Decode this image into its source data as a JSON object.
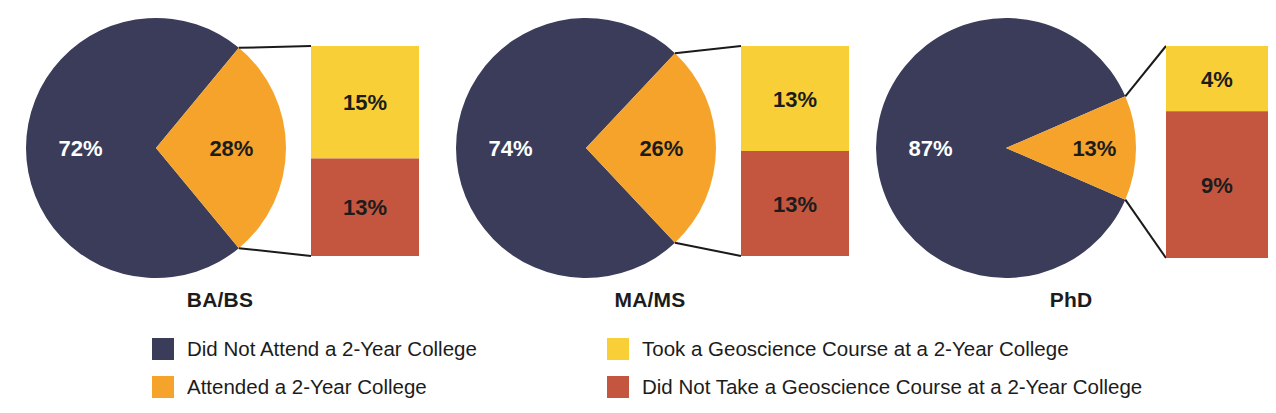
{
  "figure": {
    "background_color": "#ffffff",
    "width": 1276,
    "height": 413
  },
  "colors": {
    "navy": "#3a3c5a",
    "orange": "#f5a32a",
    "yellow": "#f8cf36",
    "red": "#c4563f",
    "leader_line": "#1a1a1a",
    "label_dark": "#1c1c1c",
    "label_light": "#ffffff"
  },
  "legend": {
    "columns": [
      {
        "items": [
          {
            "swatch_color": "#3a3c5a",
            "label": "Did Not Attend a 2-Year College"
          },
          {
            "swatch_color": "#f5a32a",
            "label": "Attended a 2-Year College"
          }
        ]
      },
      {
        "items": [
          {
            "swatch_color": "#f8cf36",
            "label": "Took a Geoscience Course at a 2-Year College"
          },
          {
            "swatch_color": "#c4563f",
            "label": "Did Not Take a Geoscience Course at a 2-Year College"
          }
        ]
      }
    ]
  },
  "chart_data": {
    "type": "pie",
    "title": "",
    "subtitle": "",
    "xlabel": "",
    "ylabel": "",
    "legend_position": "bottom",
    "grid": false,
    "note": "Three pie charts, one per degree level, each with an exploded bar-of-pie breakdown of the 'Attended a 2-Year College' slice.",
    "series_names": [
      "Did Not Attend a 2-Year College",
      "Attended a 2-Year College",
      "Took a Geoscience Course at a 2-Year College",
      "Did Not Take a Geoscience Course at a 2-Year College"
    ],
    "categories": [
      "BA/BS",
      "MA/MS",
      "PhD"
    ],
    "charts": [
      {
        "label": "BA/BS",
        "pie": {
          "slices": [
            {
              "name": "Did Not Attend a 2-Year College",
              "value": 72,
              "display": "72%",
              "color": "#3a3c5a",
              "label_color": "#ffffff"
            },
            {
              "name": "Attended a 2-Year College",
              "value": 28,
              "display": "28%",
              "color": "#f5a32a",
              "label_color": "#1c1c1c"
            }
          ]
        },
        "bar": {
          "segments": [
            {
              "name": "Took a Geoscience Course at a 2-Year College",
              "value": 15,
              "display": "15%",
              "color": "#f8cf36",
              "label_color": "#1c1c1c"
            },
            {
              "name": "Did Not Take a Geoscience Course at a 2-Year College",
              "value": 13,
              "display": "13%",
              "color": "#c4563f",
              "label_color": "#1c1c1c"
            }
          ],
          "total": 28
        }
      },
      {
        "label": "MA/MS",
        "pie": {
          "slices": [
            {
              "name": "Did Not Attend a 2-Year College",
              "value": 74,
              "display": "74%",
              "color": "#3a3c5a",
              "label_color": "#ffffff"
            },
            {
              "name": "Attended a 2-Year College",
              "value": 26,
              "display": "26%",
              "color": "#f5a32a",
              "label_color": "#1c1c1c"
            }
          ]
        },
        "bar": {
          "segments": [
            {
              "name": "Took a Geoscience Course at a 2-Year College",
              "value": 13,
              "display": "13%",
              "color": "#f8cf36",
              "label_color": "#1c1c1c"
            },
            {
              "name": "Did Not Take a Geoscience Course at a 2-Year College",
              "value": 13,
              "display": "13%",
              "color": "#c4563f",
              "label_color": "#1c1c1c"
            }
          ],
          "total": 26
        }
      },
      {
        "label": "PhD",
        "pie": {
          "slices": [
            {
              "name": "Did Not Attend a 2-Year College",
              "value": 87,
              "display": "87%",
              "color": "#3a3c5a",
              "label_color": "#ffffff"
            },
            {
              "name": "Attended a 2-Year College",
              "value": 13,
              "display": "13%",
              "color": "#f5a32a",
              "label_color": "#1c1c1c"
            }
          ]
        },
        "bar": {
          "segments": [
            {
              "name": "Took a Geoscience Course at a 2-Year College",
              "value": 4,
              "display": "4%",
              "color": "#f8cf36",
              "label_color": "#1c1c1c"
            },
            {
              "name": "Did Not Take a Geoscience Course at a 2-Year College",
              "value": 9,
              "display": "9%",
              "color": "#c4563f",
              "label_color": "#1c1c1c"
            }
          ],
          "total": 13
        }
      }
    ]
  },
  "layout": {
    "groups": [
      {
        "left": 8,
        "width": 424,
        "pie_cx": 148,
        "pie_cy": 148,
        "pie_r": 130,
        "bar_x": 303,
        "bar_w": 108,
        "bar_y": 46,
        "bar_h": 210
      },
      {
        "left": 438,
        "width": 424,
        "pie_cx": 148,
        "pie_cy": 148,
        "pie_r": 130,
        "bar_x": 303,
        "bar_w": 108,
        "bar_y": 46,
        "bar_h": 210
      },
      {
        "left": 866,
        "width": 410,
        "pie_cx": 140,
        "pie_cy": 148,
        "pie_r": 130,
        "bar_x": 300,
        "bar_w": 102,
        "bar_y": 46,
        "bar_h": 212
      }
    ]
  }
}
